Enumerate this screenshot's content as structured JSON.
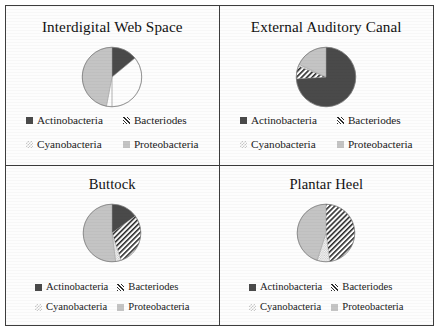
{
  "figure": {
    "legend_labels": {
      "actinobacteria": "Actinobacteria",
      "bacteriodes": "Bacteriodes",
      "cyanobacteria": "Cyanobacteria",
      "proteobacteria": "Proteobacteria"
    }
  },
  "colors": {
    "actinobacteria": "#4a4a4a",
    "bacteriodes": "#2b2b2b",
    "cyanobacteria": "#c9c9c9",
    "proteobacteria": "#c4c4c4",
    "border": "#3d3d3d",
    "background": "#fdfdfd",
    "text": "#1a1a1a"
  },
  "panels": [
    {
      "title": "Interdigital Web Space"
    },
    {
      "title": "External Auditory Canal"
    },
    {
      "title": "Buttock"
    },
    {
      "title": "Plantar Heel"
    }
  ],
  "chart_data": [
    {
      "type": "pie",
      "title": "Interdigital Web Space",
      "categories": [
        "Actinobacteria",
        "Bacteriodes",
        "Cyanobacteria",
        "Proteobacteria"
      ],
      "values": [
        14,
        36,
        3,
        47
      ],
      "start_angle": 0,
      "direction": "clockwise",
      "legend": "bottom"
    },
    {
      "type": "pie",
      "title": "External Auditory Canal",
      "categories": [
        "Actinobacteria",
        "Bacteriodes",
        "Cyanobacteria",
        "Proteobacteria"
      ],
      "values": [
        74,
        7,
        1,
        18
      ],
      "start_angle": 0,
      "direction": "clockwise",
      "legend": "bottom"
    },
    {
      "type": "pie",
      "title": "Buttock",
      "categories": [
        "Actinobacteria",
        "Bacteriodes",
        "Cyanobacteria",
        "Proteobacteria"
      ],
      "values": [
        15,
        30,
        3,
        52
      ],
      "start_angle": 0,
      "direction": "clockwise",
      "legend": "bottom"
    },
    {
      "type": "pie",
      "title": "Plantar Heel",
      "categories": [
        "Actinobacteria",
        "Bacteriodes",
        "Cyanobacteria",
        "Proteobacteria"
      ],
      "values": [
        0,
        48,
        7,
        45
      ],
      "start_angle": 0,
      "direction": "clockwise",
      "legend": "bottom"
    }
  ]
}
